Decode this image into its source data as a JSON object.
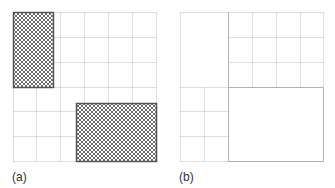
{
  "colors": {
    "grid_line": "#bdbdbd",
    "solid_line": "#b0b0b0",
    "hatch_border": "#555555",
    "hatch_fill": "#7a7a7a",
    "background": "#ffffff"
  },
  "panels": [
    {
      "id": "a",
      "label": "(a)",
      "label_pos": [
        12,
        170
      ],
      "origin": [
        13,
        12
      ],
      "size": [
        143,
        149
      ],
      "grid_cols": 6,
      "grid_rows": 6,
      "dotted_lines": [
        [
          0,
          0,
          143,
          0
        ],
        [
          0,
          149,
          143,
          149
        ],
        [
          0,
          0,
          0,
          149
        ],
        [
          143,
          0,
          143,
          149
        ],
        [
          23,
          75,
          23,
          149
        ],
        [
          47,
          0,
          47,
          149
        ],
        [
          71,
          0,
          71,
          149
        ],
        [
          95,
          0,
          95,
          149
        ],
        [
          119,
          0,
          119,
          149
        ],
        [
          40,
          25,
          143,
          25
        ],
        [
          40,
          50,
          143,
          50
        ],
        [
          0,
          75,
          143,
          75
        ],
        [
          0,
          99,
          63,
          99
        ],
        [
          0,
          124,
          63,
          124
        ]
      ],
      "solid_lines": [],
      "hatched": [
        {
          "name": "hatched-region-top-left",
          "x": 0,
          "y": 0,
          "w": 40,
          "h": 75
        },
        {
          "name": "hatched-region-bottom-right",
          "x": 63,
          "y": 91,
          "w": 80,
          "h": 58
        }
      ]
    },
    {
      "id": "b",
      "label": "(b)",
      "label_pos": [
        179,
        170
      ],
      "origin": [
        180,
        12
      ],
      "size": [
        143,
        149
      ],
      "grid_cols": 6,
      "grid_rows": 6,
      "dotted_lines": [
        [
          0,
          0,
          143,
          0
        ],
        [
          0,
          149,
          48,
          149
        ],
        [
          0,
          0,
          0,
          149
        ],
        [
          143,
          0,
          143,
          75
        ],
        [
          72,
          0,
          72,
          75
        ],
        [
          96,
          0,
          96,
          75
        ],
        [
          120,
          0,
          120,
          75
        ],
        [
          48,
          25,
          143,
          25
        ],
        [
          48,
          50,
          143,
          50
        ],
        [
          24,
          75,
          24,
          149
        ],
        [
          0,
          99,
          48,
          99
        ],
        [
          0,
          124,
          48,
          124
        ],
        [
          0,
          75,
          48,
          75
        ]
      ],
      "solid_lines": [
        [
          48,
          0,
          48,
          149
        ],
        [
          48,
          75,
          143,
          75
        ],
        [
          143,
          75,
          143,
          149
        ],
        [
          48,
          149,
          143,
          149
        ]
      ],
      "hatched": []
    }
  ]
}
